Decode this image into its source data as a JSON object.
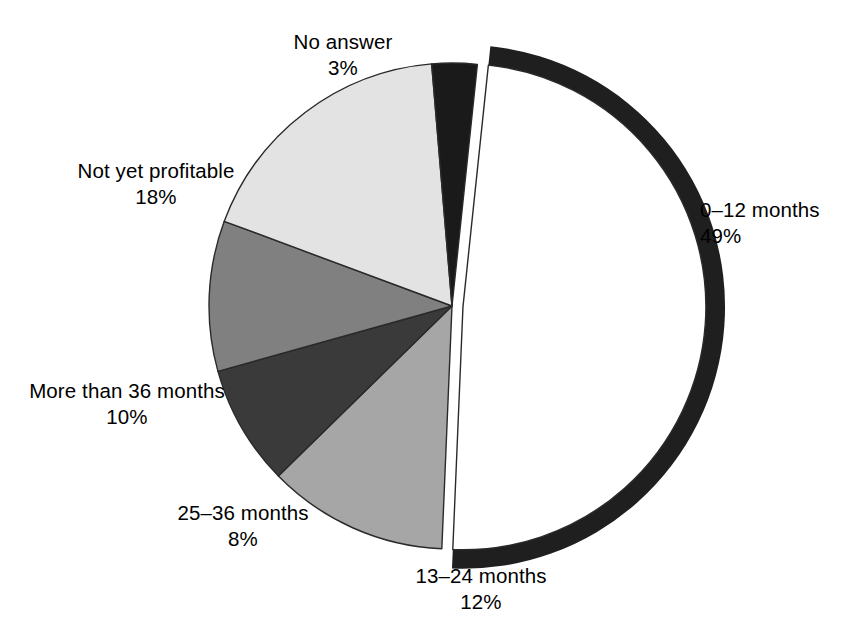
{
  "chart_data": {
    "type": "pie",
    "title": "",
    "subtitle": "",
    "xlabel": "",
    "ylabel": "",
    "legend_position": "none",
    "grid": false,
    "value_unit": "%",
    "categories": [
      "0–12 months",
      "13–24 months",
      "25–36 months",
      "More than 36 months",
      "Not yet profitable",
      "No answer"
    ],
    "values": [
      49,
      12,
      8,
      10,
      18,
      3
    ],
    "slices": [
      {
        "label": "0–12 months",
        "value": 49,
        "value_text": "49%",
        "color": "#ffffff",
        "edge_color": "#2a2a2a",
        "exploded": true,
        "shadow_color": "#1f1f1f",
        "start_angle_deg": 6,
        "end_angle_deg": 182.4
      },
      {
        "label": "13–24 months",
        "value": 12,
        "value_text": "12%",
        "color": "#a6a6a6",
        "edge_color": "#2a2a2a",
        "exploded": false,
        "start_angle_deg": 182.4,
        "end_angle_deg": 225.6
      },
      {
        "label": "25–36 months",
        "value": 8,
        "value_text": "8%",
        "color": "#3a3a3a",
        "edge_color": "#2a2a2a",
        "exploded": false,
        "start_angle_deg": 225.6,
        "end_angle_deg": 254.4
      },
      {
        "label": "More than 36 months",
        "value": 10,
        "value_text": "10%",
        "color": "#808080",
        "edge_color": "#2a2a2a",
        "exploded": false,
        "start_angle_deg": 254.4,
        "end_angle_deg": 290.4
      },
      {
        "label": "Not yet profitable",
        "value": 18,
        "value_text": "18%",
        "color": "#e3e3e3",
        "edge_color": "#2a2a2a",
        "exploded": false,
        "start_angle_deg": 290.4,
        "end_angle_deg": 355.2
      },
      {
        "label": "No answer",
        "value": 3,
        "value_text": "3%",
        "color": "#1a1a1a",
        "edge_color": "#2a2a2a",
        "exploded": false,
        "start_angle_deg": 355.2,
        "end_angle_deg": 366
      }
    ]
  },
  "labels": {
    "months_0_12": {
      "name": "0–12 months",
      "value": "49%"
    },
    "months_13_24": {
      "name": "13–24 months",
      "value": "12%"
    },
    "months_25_36": {
      "name": "25–36 months",
      "value": "8%"
    },
    "months_36_plus": {
      "name": "More than 36 months",
      "value": "10%"
    },
    "not_yet_profitable": {
      "name": "Not yet profitable",
      "value": "18%"
    },
    "no_answer": {
      "name": "No answer",
      "value": "3%"
    }
  },
  "colors": {
    "background": "#ffffff",
    "text": "#000000",
    "outline": "#2a2a2a",
    "slice_0_12": "#ffffff",
    "slice_13_24": "#a6a6a6",
    "slice_25_36": "#3a3a3a",
    "slice_36_plus": "#808080",
    "slice_not_yet": "#e3e3e3",
    "slice_no_answer": "#1a1a1a",
    "shadow_band": "#1f1f1f"
  }
}
